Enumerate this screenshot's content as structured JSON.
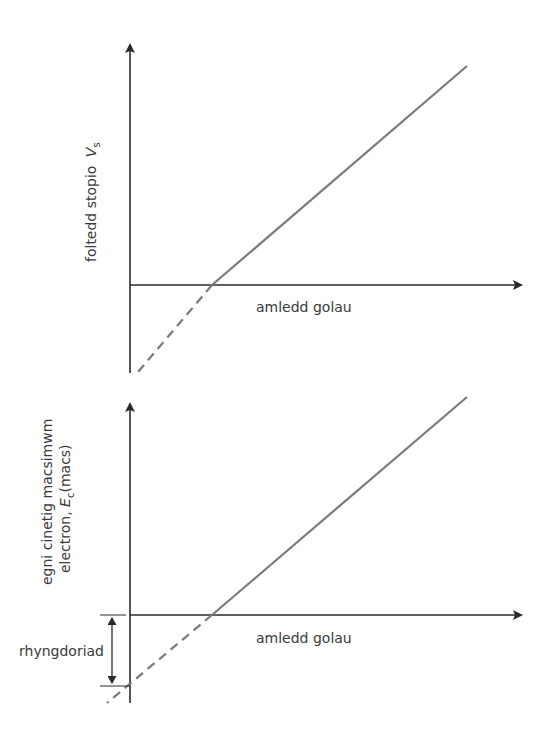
{
  "diagrams": [
    {
      "id": "top",
      "y_axis_label": "foltedd stopio",
      "y_axis_symbol": "V",
      "y_axis_subscript": "s",
      "x_axis_label": "amledd golau"
    },
    {
      "id": "bottom",
      "y_axis_label_line1": "egni cinetig macsimwm",
      "y_axis_label_line2_prefix": "electron, ",
      "y_axis_symbol": "E",
      "y_axis_subscript": "c",
      "y_axis_suffix": "(macs)",
      "x_axis_label": "amledd golau",
      "bracket_label": "rhyngdoriad"
    }
  ],
  "colors": {
    "axis": "#2a2a2a",
    "line": "#7a7a7a",
    "text": "#3a3a3a"
  }
}
